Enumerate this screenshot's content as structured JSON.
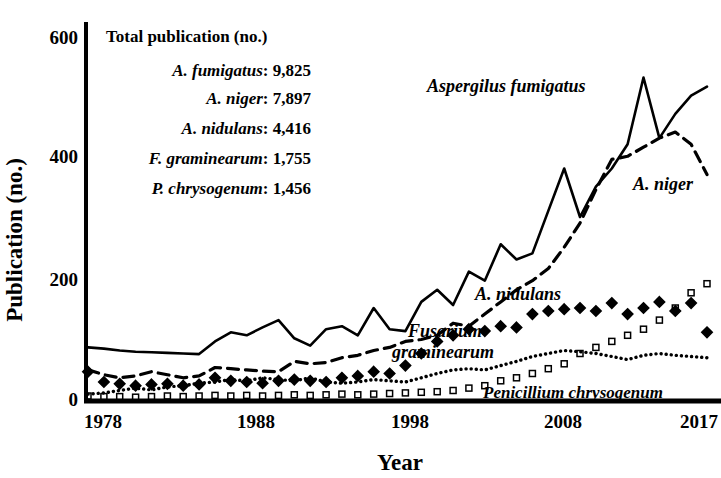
{
  "chart_data": {
    "type": "line",
    "title": "",
    "xlabel": "Year",
    "ylabel": "Publication (no.)",
    "xlim": [
      1978,
      2017
    ],
    "ylim": [
      0,
      620
    ],
    "xticks": [
      1978,
      1988,
      1998,
      2008,
      2017
    ],
    "yticks": [
      0,
      200,
      400,
      600
    ],
    "grid": false,
    "legend_position": "inline-labels",
    "x": [
      1978,
      1979,
      1980,
      1981,
      1982,
      1983,
      1984,
      1985,
      1986,
      1987,
      1988,
      1989,
      1990,
      1991,
      1992,
      1993,
      1994,
      1995,
      1996,
      1997,
      1998,
      1999,
      2000,
      2001,
      2002,
      2003,
      2004,
      2005,
      2006,
      2007,
      2008,
      2009,
      2010,
      2011,
      2012,
      2013,
      2014,
      2015,
      2016,
      2017
    ],
    "series": [
      {
        "name": "Aspergilus fumigatus",
        "label": "Aspergilus fumigatus",
        "style": "solid",
        "marker": "none",
        "color": "#000000",
        "values": [
          85,
          83,
          80,
          78,
          77,
          76,
          75,
          74,
          95,
          110,
          105,
          118,
          130,
          100,
          88,
          115,
          120,
          105,
          150,
          115,
          112,
          160,
          180,
          155,
          210,
          195,
          255,
          230,
          240,
          310,
          380,
          300,
          350,
          380,
          420,
          530,
          430,
          470,
          500,
          515
        ]
      },
      {
        "name": "A. niger",
        "label": "A. niger",
        "style": "dashed",
        "marker": "none",
        "color": "#000000",
        "values": [
          48,
          40,
          35,
          38,
          45,
          40,
          35,
          38,
          52,
          50,
          48,
          46,
          45,
          62,
          58,
          60,
          68,
          72,
          80,
          85,
          95,
          98,
          105,
          125,
          120,
          140,
          160,
          180,
          195,
          215,
          250,
          290,
          345,
          395,
          400,
          415,
          430,
          440,
          420,
          370
        ]
      },
      {
        "name": "A. nidulans",
        "label": "A. nidulans",
        "style": "markers",
        "marker": "filled-diamond",
        "color": "#000000",
        "values": [
          45,
          28,
          25,
          22,
          24,
          25,
          22,
          24,
          35,
          30,
          28,
          26,
          30,
          32,
          30,
          28,
          35,
          38,
          45,
          42,
          55,
          75,
          95,
          105,
          115,
          112,
          120,
          118,
          140,
          145,
          148,
          150,
          145,
          158,
          140,
          150,
          160,
          145,
          158,
          110
        ]
      },
      {
        "name": "Fusarium graminearum",
        "label": "Fusarium graminearum",
        "style": "markers",
        "marker": "open-square",
        "color": "#000000",
        "values": [
          5,
          4,
          4,
          3,
          4,
          5,
          4,
          5,
          6,
          5,
          6,
          5,
          6,
          7,
          6,
          7,
          8,
          7,
          8,
          9,
          10,
          11,
          12,
          14,
          18,
          22,
          30,
          35,
          42,
          50,
          58,
          75,
          85,
          95,
          105,
          115,
          130,
          150,
          175,
          190
        ]
      },
      {
        "name": "Penicillium chrysogenum",
        "label": "Penicillium chrysogenum",
        "style": "dotted",
        "marker": "none",
        "color": "#000000",
        "values": [
          8,
          10,
          14,
          18,
          15,
          20,
          22,
          26,
          28,
          32,
          30,
          35,
          32,
          30,
          35,
          28,
          26,
          28,
          32,
          30,
          28,
          35,
          42,
          48,
          50,
          48,
          55,
          62,
          70,
          75,
          80,
          78,
          75,
          70,
          65,
          72,
          75,
          72,
          70,
          68
        ]
      }
    ]
  },
  "axes": {
    "ylabel": "Publication (no.)",
    "xlabel": "Year",
    "ytick_labels": [
      "600",
      "400",
      "200",
      "0"
    ],
    "xtick_labels": [
      "1978",
      "1988",
      "1998",
      "2008",
      "2017"
    ]
  },
  "legend_box": {
    "title": "Total publication (no.)",
    "rows": [
      {
        "species": "A. fumigatus",
        "sep": ": ",
        "value": "9,825"
      },
      {
        "species": "A. niger",
        "sep": ": ",
        "value": "7,897"
      },
      {
        "species": "A. nidulans",
        "sep": ": ",
        "value": "4,416"
      },
      {
        "species": "F. graminearum",
        "sep": ": ",
        "value": "1,755"
      },
      {
        "species": "P. chrysogenum",
        "sep": ": ",
        "value": "1,456"
      }
    ]
  },
  "series_labels": {
    "fumigatus": "Aspergilus fumigatus",
    "niger": "A. niger",
    "nidulans": "A. nidulans",
    "graminearum_line1": "Fusarium",
    "graminearum_line2": "graminearum",
    "chrysogenum": "Penicillium chrysogenum"
  }
}
